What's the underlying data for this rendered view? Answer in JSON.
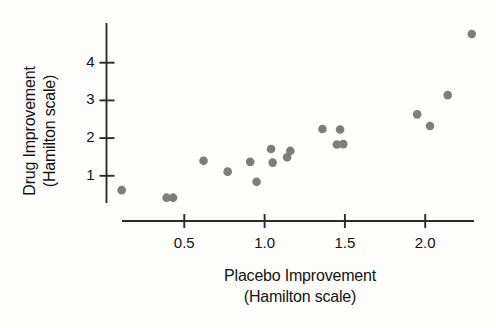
{
  "chart_data": {
    "type": "scatter",
    "title": "",
    "xlabel": "Placebo Improvement",
    "xlabel_line2": "(Hamilton scale)",
    "ylabel": "Drug Improvement",
    "ylabel_line2": "(Hamilton scale)",
    "xticks": [
      0.5,
      1.0,
      1.5,
      2.0
    ],
    "xticklabels": [
      "0.5",
      "1.0",
      "1.5",
      "2.0"
    ],
    "yticks": [
      1,
      2,
      3,
      4
    ],
    "yticklabels": [
      "1",
      "2",
      "3",
      "4"
    ],
    "xlim": [
      0.0,
      2.44
    ],
    "ylim": [
      0.25,
      5.1
    ],
    "grid": false,
    "legend": null,
    "marker_color": "#7d7d7d",
    "axis_color": "#2b2b2b",
    "background": "#fdfdfb",
    "points": [
      {
        "x": 0.11,
        "y": 0.62
      },
      {
        "x": 0.39,
        "y": 0.42
      },
      {
        "x": 0.43,
        "y": 0.42
      },
      {
        "x": 0.62,
        "y": 1.4
      },
      {
        "x": 0.77,
        "y": 1.11
      },
      {
        "x": 0.91,
        "y": 1.37
      },
      {
        "x": 0.95,
        "y": 0.84
      },
      {
        "x": 1.04,
        "y": 1.71
      },
      {
        "x": 1.05,
        "y": 1.35
      },
      {
        "x": 1.14,
        "y": 1.49
      },
      {
        "x": 1.16,
        "y": 1.66
      },
      {
        "x": 1.36,
        "y": 2.24
      },
      {
        "x": 1.45,
        "y": 1.83
      },
      {
        "x": 1.47,
        "y": 2.23
      },
      {
        "x": 1.49,
        "y": 1.84
      },
      {
        "x": 1.95,
        "y": 2.63
      },
      {
        "x": 2.03,
        "y": 2.32
      },
      {
        "x": 2.14,
        "y": 3.14
      },
      {
        "x": 2.29,
        "y": 4.76
      }
    ]
  }
}
